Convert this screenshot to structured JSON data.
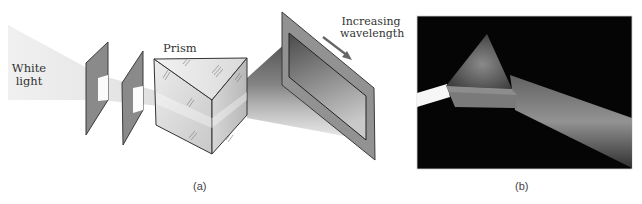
{
  "figure": {
    "panel_a": {
      "caption": "(a)",
      "labels": {
        "source_line1": "White",
        "source_line2": "light",
        "prism": "Prism",
        "arrow_line1": "Increasing",
        "arrow_line2": "wavelength"
      },
      "elements": [
        "white-light-beam",
        "aperture-plate-1",
        "aperture-plate-2",
        "glass-prism",
        "dispersed-beam",
        "projection-screen",
        "wavelength-arrow"
      ]
    },
    "panel_b": {
      "caption": "(b)",
      "description": "Photograph of white light beam entering a glass prism and emerging as a spread beam on black background",
      "elements": [
        "photo-incident-beam",
        "photo-prism",
        "photo-dispersed-beam"
      ]
    },
    "colors": {
      "plate": "#8a8a8a",
      "plate_edge": "#3a3a3a",
      "screen_frame": "#929292",
      "photo_background": "#050505",
      "text": "#333333"
    }
  }
}
